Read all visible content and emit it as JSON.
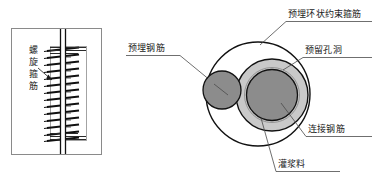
{
  "diagram": {
    "title_alt": "",
    "colors": {
      "line": "#1a1a1a",
      "thin_line": "#6f6f6f",
      "fill_dark_gray": "#8c8c8c",
      "fill_mid_gray": "#999999",
      "fill_light_gray": "#c9c9c9",
      "background": "#ffffff",
      "text": "#1a1a1a"
    },
    "left_view": {
      "name": "elevation-view",
      "frame": {
        "x": 11,
        "y": 28,
        "w": 91,
        "h": 127
      },
      "label": {
        "text": "螺旋箍筋",
        "chars": [
          "螺",
          "旋",
          "箍",
          "筋"
        ],
        "orientation": "vertical"
      },
      "rebar": {
        "x": 62,
        "top": 30,
        "bottom": 153,
        "width": 5
      },
      "spiral": {
        "turns": 14,
        "top": 46,
        "bottom": 140,
        "half_width": 16
      },
      "sleeve": {
        "x": 50,
        "y": 46,
        "w": 36,
        "h": 94
      }
    },
    "right_view": {
      "name": "section-view",
      "outer_circle": {
        "cx": 258,
        "cy": 94,
        "r": 52
      },
      "hole_circle": {
        "cx": 272,
        "cy": 95,
        "r": 36
      },
      "grout_ring": {
        "cx": 272,
        "cy": 95,
        "r_outer": 36,
        "r_inner": 26
      },
      "connect_bar": {
        "cx": 272,
        "cy": 95,
        "r": 26
      },
      "embedded_bar": {
        "cx": 222,
        "cy": 90,
        "r": 19
      }
    },
    "labels": [
      {
        "id": "embedded-rebar",
        "text": "预埋钢筋",
        "position": "center-top"
      },
      {
        "id": "ring-stirrup",
        "text": "预埋环状约束箍筋",
        "position": "top-right"
      },
      {
        "id": "reserved-hole",
        "text": "预留孔洞",
        "position": "upper-right"
      },
      {
        "id": "connecting-rebar",
        "text": "连接钢筋",
        "position": "lower-right"
      },
      {
        "id": "grouting-material",
        "text": "灌浆料",
        "position": "bottom"
      },
      {
        "id": "spiral-stirrup",
        "text": "螺旋箍筋",
        "position": "left"
      }
    ]
  }
}
